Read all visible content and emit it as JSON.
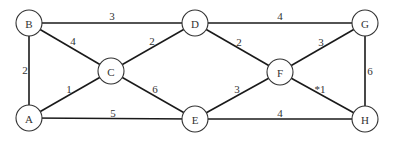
{
  "diagram": {
    "type": "weighted-undirected-graph",
    "nodes": [
      {
        "id": "A",
        "label": "A",
        "x": 29,
        "y": 118
      },
      {
        "id": "B",
        "label": "B",
        "x": 29,
        "y": 23
      },
      {
        "id": "C",
        "label": "C",
        "x": 111,
        "y": 71
      },
      {
        "id": "D",
        "label": "D",
        "x": 195,
        "y": 23
      },
      {
        "id": "E",
        "label": "E",
        "x": 195,
        "y": 119
      },
      {
        "id": "F",
        "label": "F",
        "x": 280,
        "y": 72
      },
      {
        "id": "G",
        "label": "G",
        "x": 365,
        "y": 23
      },
      {
        "id": "H",
        "label": "H",
        "x": 365,
        "y": 119
      }
    ],
    "edges": [
      {
        "from": "B",
        "to": "D",
        "weight": "3",
        "lx": 112,
        "ly": 16
      },
      {
        "from": "D",
        "to": "G",
        "weight": "4",
        "lx": 280,
        "ly": 16
      },
      {
        "from": "B",
        "to": "C",
        "weight": "4",
        "lx": 73,
        "ly": 41
      },
      {
        "from": "C",
        "to": "D",
        "weight": "2",
        "lx": 152,
        "ly": 41
      },
      {
        "from": "D",
        "to": "F",
        "weight": "2",
        "lx": 239,
        "ly": 42
      },
      {
        "from": "F",
        "to": "G",
        "weight": "3",
        "lx": 321,
        "ly": 42
      },
      {
        "from": "B",
        "to": "A",
        "weight": "2",
        "lx": 25,
        "ly": 70
      },
      {
        "from": "G",
        "to": "H",
        "weight": "6",
        "lx": 370,
        "ly": 71
      },
      {
        "from": "A",
        "to": "C",
        "weight": "1",
        "lx": 69,
        "ly": 89
      },
      {
        "from": "C",
        "to": "E",
        "weight": "6",
        "lx": 155,
        "ly": 89
      },
      {
        "from": "E",
        "to": "F",
        "weight": "3",
        "lx": 237,
        "ly": 89
      },
      {
        "from": "F",
        "to": "H",
        "weight": "*1",
        "lx": 320,
        "ly": 89
      },
      {
        "from": "A",
        "to": "E",
        "weight": "5",
        "lx": 113,
        "ly": 113
      },
      {
        "from": "E",
        "to": "H",
        "weight": "4",
        "lx": 280,
        "ly": 113
      }
    ],
    "node_radius": 13,
    "colors": {
      "edge": "#1a1a1a",
      "node_stroke": "#333333",
      "text": "#333333",
      "background": "#ffffff"
    }
  }
}
